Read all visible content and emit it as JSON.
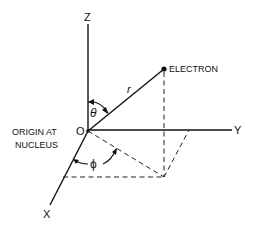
{
  "diagram": {
    "type": "spherical-coordinate-system",
    "labels": {
      "z_axis": "Z",
      "y_axis": "Y",
      "x_axis": "X",
      "origin": "O",
      "radius": "r",
      "theta": "θ",
      "phi": "ϕ",
      "electron": "ELECTRON",
      "origin_note_line1": "ORIGIN AT",
      "origin_note_line2": "NUCLEUS"
    },
    "points": {
      "origin": [
        88,
        131
      ],
      "electron": [
        164,
        69
      ],
      "projection": [
        164,
        177
      ],
      "z_end": [
        88,
        24
      ],
      "y_end": [
        232,
        130
      ],
      "x_end": [
        50,
        205
      ],
      "y_projection": [
        189,
        130
      ],
      "x_projection": [
        63,
        177
      ]
    },
    "colors": {
      "line": "#111111",
      "background": "#ffffff"
    }
  }
}
